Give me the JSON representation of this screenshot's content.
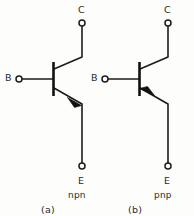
{
  "figure": {
    "type": "bipolar-junction-transistor-symbols",
    "background_color": "#fdfdfc",
    "line_color": "#1c1c1c"
  },
  "npn": {
    "collector_label": "C",
    "base_label": "B",
    "emitter_label": "E",
    "type_label": "npn",
    "caption": "(a)",
    "arrow_direction": "outward-from-base",
    "arrow_on": "emitter"
  },
  "pnp": {
    "collector_label": "C",
    "base_label": "B",
    "emitter_label": "E",
    "type_label": "pnp",
    "caption": "(b)",
    "arrow_direction": "inward-toward-base",
    "arrow_on": "emitter"
  }
}
